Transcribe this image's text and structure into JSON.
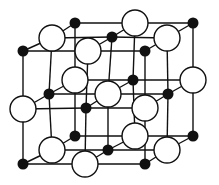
{
  "diagram": {
    "title": "",
    "colors": {
      "bond": "#111111",
      "large_fill": "#ffffff",
      "small_fill": "#111111",
      "background": "#ffffff"
    },
    "large_radius": 13,
    "small_radius": 5.5,
    "layers": [
      {
        "name": "top",
        "rows": [
          [
            {
              "x": 75,
              "y": 23,
              "type": "small"
            },
            {
              "x": 135,
              "y": 23,
              "type": "large"
            },
            {
              "x": 193,
              "y": 23,
              "type": "small"
            }
          ],
          [
            {
              "x": 52,
              "y": 38,
              "type": "large"
            },
            {
              "x": 112,
              "y": 37,
              "type": "small"
            },
            {
              "x": 167,
              "y": 38,
              "type": "large"
            }
          ],
          [
            {
              "x": 23,
              "y": 51,
              "type": "small"
            },
            {
              "x": 88,
              "y": 51,
              "type": "large"
            },
            {
              "x": 145,
              "y": 51,
              "type": "small"
            }
          ]
        ]
      },
      {
        "name": "middle",
        "rows": [
          [
            {
              "x": 75,
              "y": 80,
              "type": "large"
            },
            {
              "x": 133,
              "y": 80,
              "type": "small"
            },
            {
              "x": 193,
              "y": 80,
              "type": "large"
            }
          ],
          [
            {
              "x": 49,
              "y": 94,
              "type": "small"
            },
            {
              "x": 108,
              "y": 94,
              "type": "large"
            },
            {
              "x": 168,
              "y": 94,
              "type": "small"
            }
          ],
          [
            {
              "x": 23,
              "y": 109,
              "type": "large"
            },
            {
              "x": 86,
              "y": 108,
              "type": "small"
            },
            {
              "x": 145,
              "y": 108,
              "type": "large"
            }
          ]
        ]
      },
      {
        "name": "bottom",
        "rows": [
          [
            {
              "x": 75,
              "y": 136,
              "type": "small"
            },
            {
              "x": 135,
              "y": 136,
              "type": "large"
            },
            {
              "x": 193,
              "y": 136,
              "type": "small"
            }
          ],
          [
            {
              "x": 52,
              "y": 150,
              "type": "large"
            },
            {
              "x": 108,
              "y": 150,
              "type": "small"
            },
            {
              "x": 167,
              "y": 150,
              "type": "large"
            }
          ],
          [
            {
              "x": 23,
              "y": 164,
              "type": "small"
            },
            {
              "x": 85,
              "y": 164,
              "type": "large"
            },
            {
              "x": 145,
              "y": 164,
              "type": "small"
            }
          ]
        ]
      }
    ]
  }
}
